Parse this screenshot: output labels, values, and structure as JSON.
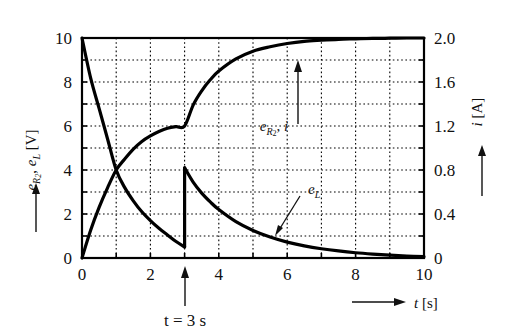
{
  "chart_data": {
    "type": "line",
    "title": "",
    "xlabel": "t [s]",
    "ylabel": "e_R2, e_L [V]",
    "y2label": "i [A]",
    "xlim": [
      0,
      10
    ],
    "ylim": [
      0,
      10
    ],
    "y2lim": [
      0,
      2.0
    ],
    "grid": true,
    "grid_style": "dotted",
    "legend_position": "inline-annotations",
    "x_ticks": [
      0,
      2,
      4,
      6,
      8,
      10
    ],
    "x_tick_labels": [
      "0",
      "2",
      "4",
      "6",
      "8",
      "10"
    ],
    "x_minor_step": 1,
    "y_ticks": [
      0,
      2,
      4,
      6,
      8,
      10
    ],
    "y_tick_labels": [
      "0",
      "2",
      "4",
      "6",
      "8",
      "10"
    ],
    "y_minor_step": 1,
    "y2_ticks": [
      0,
      0.4,
      0.8,
      1.2,
      1.6,
      2.0
    ],
    "y2_tick_labels": [
      "0",
      "0.4",
      "0.8",
      "1.2",
      "1.6",
      "2.0"
    ],
    "event_time": 3,
    "event_label": "t = 3 s",
    "series": [
      {
        "name": "e_R2, i",
        "axis": "both",
        "note": "rising exponential, kink at t=3 s where value is 6 V / 1.2 A, saturates at 10 V / 2.0 A",
        "x": [
          0,
          0.25,
          0.5,
          0.75,
          1.0,
          1.25,
          1.5,
          1.75,
          2.0,
          2.25,
          2.5,
          2.75,
          3.0,
          3.25,
          3.5,
          3.75,
          4.0,
          4.5,
          5.0,
          5.5,
          6.0,
          6.5,
          7.0,
          7.5,
          8.0,
          8.5,
          9.0,
          9.5,
          10.0
        ],
        "values": [
          0.0,
          1.25,
          2.3,
          3.2,
          4.0,
          4.5,
          4.95,
          5.3,
          5.55,
          5.75,
          5.9,
          5.97,
          6.0,
          6.95,
          7.6,
          8.1,
          8.5,
          9.05,
          9.4,
          9.6,
          9.75,
          9.85,
          9.9,
          9.94,
          9.96,
          9.98,
          9.99,
          10.0,
          10.0
        ]
      },
      {
        "name": "e_L",
        "axis": "left",
        "note": "decaying exponential from 10 V, discontinuous jump at t=3 s from 0.5 V to 4.1 V, then decays to 0",
        "x": [
          0,
          0.25,
          0.5,
          0.75,
          1.0,
          1.25,
          1.5,
          1.75,
          2.0,
          2.25,
          2.5,
          2.75,
          3.0,
          3.0,
          3.25,
          3.5,
          3.75,
          4.0,
          4.5,
          5.0,
          5.5,
          6.0,
          6.5,
          7.0,
          7.5,
          8.0,
          8.5,
          9.0,
          9.5,
          10.0
        ],
        "values": [
          10.0,
          8.2,
          6.8,
          5.4,
          4.0,
          3.2,
          2.6,
          2.1,
          1.7,
          1.35,
          1.05,
          0.75,
          0.5,
          4.1,
          3.45,
          2.95,
          2.55,
          2.2,
          1.65,
          1.25,
          0.95,
          0.72,
          0.55,
          0.42,
          0.32,
          0.24,
          0.18,
          0.13,
          0.09,
          0.06
        ]
      }
    ],
    "annotations": [
      {
        "name": "e_R2-i-annotation",
        "text": "e",
        "sub": "R",
        "sub2": "2",
        "full_text": "e_R2, i",
        "arrow": "up"
      },
      {
        "name": "eL-annotation",
        "text": "e",
        "sub": "L",
        "full_text": "e_L",
        "arrow": "leader-line"
      },
      {
        "name": "event-annotation",
        "text": "t = 3 s",
        "arrow": "up"
      }
    ]
  },
  "axes": {
    "left": {
      "symbol_1": "e",
      "sub_1": "R",
      "sub_1b": "2",
      "symbol_2": "e",
      "sub_2": "L",
      "unit": "[V]",
      "arrow_direction": "up"
    },
    "right": {
      "symbol": "i",
      "unit": "[A]",
      "arrow_direction": "up"
    },
    "bottom": {
      "symbol": "t",
      "unit": "[s]",
      "arrow_direction": "right"
    }
  },
  "colors": {
    "curve": "#000000",
    "frame": "#000000",
    "grid": "#000000",
    "background": "#ffffff",
    "text": "#111111"
  }
}
